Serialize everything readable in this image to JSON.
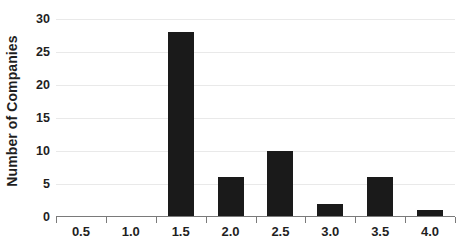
{
  "chart_data": {
    "type": "bar",
    "title": "",
    "subtitle": "",
    "xlabel": "",
    "ylabel": "Number of Companies",
    "categories": [
      "0.5",
      "1.0",
      "1.5",
      "2.0",
      "2.5",
      "3.0",
      "3.5",
      "4.0"
    ],
    "values": [
      0,
      0,
      28,
      6,
      10,
      2,
      6,
      1
    ],
    "ylim": [
      0,
      30
    ],
    "yticks": [
      0,
      5,
      10,
      15,
      20,
      25,
      30
    ],
    "ytick_labels": [
      "0",
      "5",
      "10",
      "15",
      "20",
      "25",
      "30"
    ],
    "grid": true,
    "grid_axis": "y",
    "legend": false,
    "legend_position": "none",
    "bar_color": "#1a1a1a",
    "gridline_color": "#e9e9e9",
    "axis_color": "#7a7a7a",
    "background_color": "#ffffff",
    "text_color": "#1f1f1f"
  }
}
